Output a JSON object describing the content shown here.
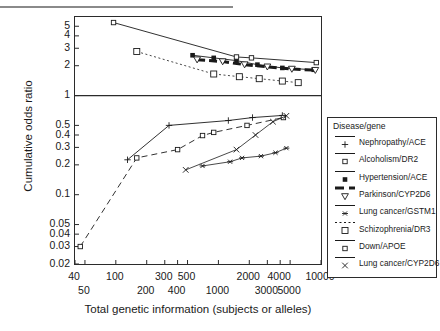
{
  "chart_data": {
    "type": "line",
    "title": "",
    "xlabel": "Total genetic information (subjects or alleles)",
    "ylabel": "Cumulative odds ratio",
    "xscale": "log",
    "yscale": "log",
    "xlim": [
      40,
      10000
    ],
    "ylim": [
      0.02,
      6.2
    ],
    "grid": false,
    "legend_position": "right-outside",
    "legend_title": "Disease/gene",
    "reference_line": {
      "y": 1,
      "style": "solid"
    },
    "x_ticks_upper": [
      "40",
      "100",
      "300",
      "500",
      "2000",
      "4000",
      "10000"
    ],
    "x_ticks_lower": [
      "50",
      "200",
      "400",
      "1000",
      "3000",
      "5000"
    ],
    "x_tick_values_upper": [
      40,
      100,
      300,
      500,
      2000,
      4000,
      10000
    ],
    "x_tick_values_lower": [
      50,
      200,
      400,
      1000,
      3000,
      5000
    ],
    "y_ticks": [
      "5",
      "4",
      "3",
      "2",
      "1",
      "0.5",
      "0.4",
      "0.3",
      "0.2",
      "0.1",
      "0.05",
      "0.04",
      "0.03",
      "0.02"
    ],
    "y_tick_values": [
      5,
      4,
      3,
      2,
      1,
      0.5,
      0.4,
      0.3,
      0.2,
      0.1,
      0.05,
      0.04,
      0.03,
      0.02
    ],
    "series": [
      {
        "name": "Nephropathy/ACE",
        "marker": "plus",
        "line": "solid",
        "color": "#1a1a1a",
        "points": [
          {
            "x": 130,
            "y": 0.225
          },
          {
            "x": 330,
            "y": 0.5
          },
          {
            "x": 1250,
            "y": 0.56
          },
          {
            "x": 2150,
            "y": 0.6
          },
          {
            "x": 4200,
            "y": 0.63
          }
        ]
      },
      {
        "name": "Alcoholism/DR2",
        "marker": "small-square",
        "line": "dashed",
        "color": "#1a1a1a",
        "points": [
          {
            "x": 45,
            "y": 0.03
          },
          {
            "x": 160,
            "y": 0.235
          },
          {
            "x": 400,
            "y": 0.285
          },
          {
            "x": 700,
            "y": 0.395
          },
          {
            "x": 900,
            "y": 0.425
          },
          {
            "x": 1900,
            "y": 0.5
          },
          {
            "x": 4300,
            "y": 0.6
          }
        ]
      },
      {
        "name": "Hypertension/ACE",
        "marker": "filled-square",
        "line": "solid",
        "color": "#1a1a1a",
        "points": [
          {
            "x": 560,
            "y": 2.55
          },
          {
            "x": 900,
            "y": 2.4
          },
          {
            "x": 1500,
            "y": 2.25
          },
          {
            "x": 2400,
            "y": 2.05
          },
          {
            "x": 4200,
            "y": 1.9
          },
          {
            "x": 8500,
            "y": 1.82
          }
        ]
      },
      {
        "name": "Parkinson/CYP2D6",
        "marker": "triangle-down",
        "line": "heavy-dash",
        "color": "#1a1a1a",
        "points": [
          {
            "x": 620,
            "y": 2.3
          },
          {
            "x": 1100,
            "y": 2.2
          },
          {
            "x": 1800,
            "y": 2.05
          },
          {
            "x": 3000,
            "y": 1.95
          },
          {
            "x": 5200,
            "y": 1.85
          },
          {
            "x": 8800,
            "y": 1.8
          }
        ]
      },
      {
        "name": "Lung cancer/GSTM1",
        "marker": "asterisk",
        "line": "solid-thin",
        "color": "#1a1a1a",
        "points": [
          {
            "x": 700,
            "y": 0.195
          },
          {
            "x": 1300,
            "y": 0.215
          },
          {
            "x": 1700,
            "y": 0.235
          },
          {
            "x": 2600,
            "y": 0.245
          },
          {
            "x": 3600,
            "y": 0.265
          },
          {
            "x": 4600,
            "y": 0.295
          }
        ]
      },
      {
        "name": "Schizophrenia/DR3",
        "marker": "open-square",
        "line": "dotted",
        "color": "#1a1a1a",
        "points": [
          {
            "x": 160,
            "y": 2.78
          },
          {
            "x": 900,
            "y": 1.65
          },
          {
            "x": 1600,
            "y": 1.55
          },
          {
            "x": 2500,
            "y": 1.48
          },
          {
            "x": 4200,
            "y": 1.4
          },
          {
            "x": 6000,
            "y": 1.35
          }
        ]
      },
      {
        "name": "Down/APOE",
        "marker": "small-square",
        "line": "solid",
        "color": "#1a1a1a",
        "points": [
          {
            "x": 95,
            "y": 5.45
          },
          {
            "x": 1500,
            "y": 2.45
          },
          {
            "x": 2100,
            "y": 2.4
          },
          {
            "x": 9000,
            "y": 2.15
          }
        ]
      },
      {
        "name": "Lung cancer/CYP2D6",
        "marker": "cross",
        "line": "solid-thin",
        "color": "#1a1a1a",
        "points": [
          {
            "x": 480,
            "y": 0.178
          },
          {
            "x": 1500,
            "y": 0.285
          },
          {
            "x": 2300,
            "y": 0.4
          },
          {
            "x": 3400,
            "y": 0.545
          },
          {
            "x": 4600,
            "y": 0.625
          }
        ]
      }
    ]
  },
  "legend": {
    "title": "Disease/gene",
    "items": [
      {
        "label": "Nephropathy/ACE",
        "marker": "plus",
        "line": "solid"
      },
      {
        "label": "Alcoholism/DR2",
        "marker": "small-square",
        "line": "solid"
      },
      {
        "label": "Hypertension/ACE",
        "marker": "filled-square",
        "line": "solid"
      },
      {
        "label": "Parkinson/CYP2D6",
        "marker": "triangle-down",
        "line": "heavy-dash"
      },
      {
        "label": "Lung cancer/GSTM1",
        "marker": "asterisk",
        "line": "solid"
      },
      {
        "label": "Schizophrenia/DR3",
        "marker": "open-square",
        "line": "dotted"
      },
      {
        "label": "Down/APOE",
        "marker": "small-square",
        "line": "solid"
      },
      {
        "label": "Lung cancer/CYP2D6",
        "marker": "cross",
        "line": "solid"
      }
    ]
  },
  "axes": {
    "xlabel": "Total genetic information (subjects or alleles)",
    "ylabel": "Cumulative odds ratio"
  }
}
